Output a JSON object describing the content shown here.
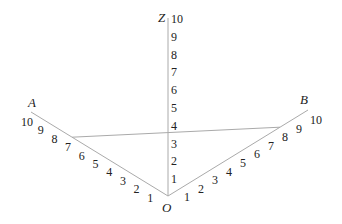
{
  "diagram": {
    "type": "nomogram",
    "origin": {
      "label": "O",
      "x": 168,
      "y": 196
    },
    "axes": [
      {
        "name": "Z",
        "label": "Z",
        "end": {
          "x": 168,
          "y": 18
        },
        "ticks": [
          "1",
          "2",
          "3",
          "4",
          "5",
          "6",
          "7",
          "8",
          "9",
          "10"
        ]
      },
      {
        "name": "A",
        "label": "A",
        "end": {
          "x": 31,
          "y": 112
        },
        "ticks": [
          "1",
          "2",
          "3",
          "4",
          "5",
          "6",
          "7",
          "8",
          "9",
          "10"
        ]
      },
      {
        "name": "B",
        "label": "B",
        "end": {
          "x": 308,
          "y": 110
        },
        "ticks": [
          "1",
          "2",
          "3",
          "4",
          "5",
          "6",
          "7",
          "8",
          "9",
          "10"
        ]
      }
    ],
    "connector": {
      "from_axis": "A",
      "from_value": 7,
      "to_axis": "B",
      "to_value": 8,
      "crosses_axis": "Z",
      "crosses_value": 4
    },
    "colors": {
      "axis": "#aaaaaa",
      "text": "#222222"
    }
  }
}
